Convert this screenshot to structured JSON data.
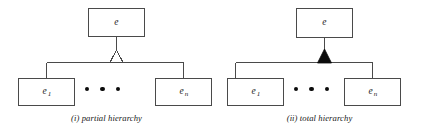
{
  "figure": {
    "background_color": "#ffffff",
    "line_color": "#4a4a4a",
    "fill_color": "#0b0b0b",
    "panels": [
      {
        "id": "partial-hierarchy",
        "caption": "(i) partial hierarchy",
        "connector_type": "open-triangle",
        "parent": {
          "label": "e",
          "subscript": ""
        },
        "children": [
          {
            "label": "e",
            "subscript": "1"
          },
          {
            "label": "e",
            "subscript": "n"
          }
        ],
        "ellipsis": "• • •"
      },
      {
        "id": "total-hierarchy",
        "caption": "(ii) total hierarchy",
        "connector_type": "filled-triangle",
        "parent": {
          "label": "e",
          "subscript": ""
        },
        "children": [
          {
            "label": "e",
            "subscript": "1"
          },
          {
            "label": "e",
            "subscript": "n"
          }
        ],
        "ellipsis": "• • •"
      }
    ]
  }
}
